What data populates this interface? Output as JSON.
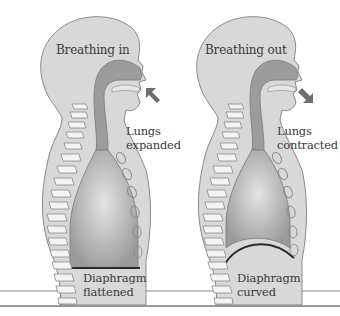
{
  "diagram": {
    "colors": {
      "background": "#ffffff",
      "body": "#d6d6d6",
      "outline": "#8a8a8a",
      "airway": "#9a9a9a",
      "lung": "#a8a8a8",
      "lung_highlight": "#dedede",
      "spine": "#f4f4f4",
      "arrow": "#6e6e6e",
      "diaphragm_line": "#2a2a2a",
      "text": "#3a3a3a",
      "floor_line": "#888888"
    },
    "panels": [
      {
        "id": "inhale",
        "title": "Breathing in",
        "lung_label_line1": "Lungs",
        "lung_label_line2": "expanded",
        "diaphragm_label_line1": "Diaphragm",
        "diaphragm_label_line2": "flattened",
        "arrow_direction": "in"
      },
      {
        "id": "exhale",
        "title": "Breathing out",
        "lung_label_line1": "Lungs",
        "lung_label_line2": "contracted",
        "diaphragm_label_line1": "Diaphragm",
        "diaphragm_label_line2": "curved",
        "arrow_direction": "out"
      }
    ]
  }
}
